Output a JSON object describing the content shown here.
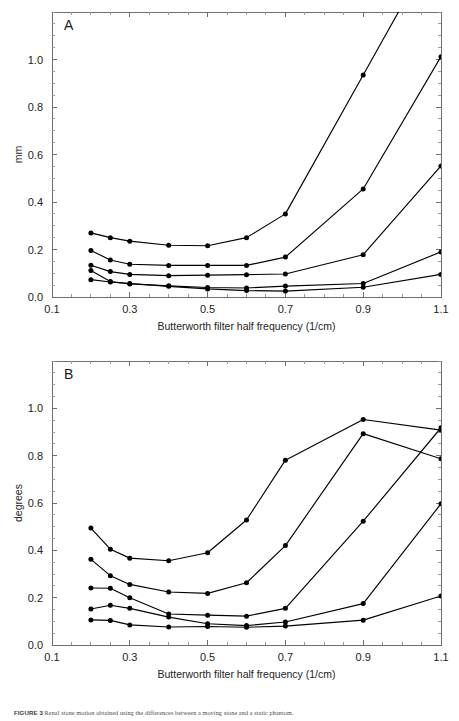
{
  "figure": {
    "caption_label": "FIGURE 3",
    "caption_text": "Renal stone motion obtained using the differences between a moving stone and a static phantom."
  },
  "chart_data": [
    {
      "type": "line",
      "panel": "A",
      "title": "",
      "xlabel": "Butterworth filter half frequency (1/cm)",
      "ylabel": "mm",
      "xlim": [
        0.1,
        1.1
      ],
      "ylim": [
        0.0,
        1.2
      ],
      "xticks": [
        0.1,
        0.3,
        0.5,
        0.7,
        0.9,
        1.1
      ],
      "xtick_labels": [
        "0.1",
        "0.3",
        "0.5",
        "0.7",
        "0.9",
        "1.1"
      ],
      "yticks": [
        0.0,
        0.2,
        0.4,
        0.6,
        0.8,
        1.0
      ],
      "ytick_labels": [
        "0.0",
        "0.2",
        "0.4",
        "0.6",
        "0.8",
        "1.0"
      ],
      "x_minor_step": 0.05,
      "y_minor_step": 0.05,
      "grid": false,
      "legend": "none",
      "x": [
        0.2,
        0.25,
        0.3,
        0.4,
        0.5,
        0.6,
        0.7,
        0.8,
        0.9,
        1.1
      ],
      "series": [
        {
          "name": "series-1",
          "x": [
            0.2,
            0.25,
            0.3,
            0.4,
            0.5,
            0.6,
            0.7,
            0.9,
            1.1
          ],
          "values": [
            0.27,
            0.25,
            0.235,
            0.218,
            0.216,
            0.25,
            0.35,
            0.935,
            1.52
          ]
        },
        {
          "name": "series-2",
          "x": [
            0.2,
            0.25,
            0.3,
            0.4,
            0.5,
            0.6,
            0.7,
            0.9,
            1.1
          ],
          "values": [
            0.196,
            0.156,
            0.138,
            0.133,
            0.133,
            0.133,
            0.168,
            0.455,
            1.012
          ]
        },
        {
          "name": "series-3",
          "x": [
            0.2,
            0.25,
            0.3,
            0.4,
            0.5,
            0.6,
            0.7,
            0.9,
            1.1
          ],
          "values": [
            0.134,
            0.107,
            0.095,
            0.09,
            0.092,
            0.094,
            0.097,
            0.178,
            0.552
          ]
        },
        {
          "name": "series-4",
          "x": [
            0.2,
            0.25,
            0.3,
            0.4,
            0.5,
            0.6,
            0.7,
            0.9,
            1.1
          ],
          "values": [
            0.112,
            0.065,
            0.055,
            0.047,
            0.04,
            0.038,
            0.046,
            0.057,
            0.19
          ]
        },
        {
          "name": "series-5",
          "x": [
            0.2,
            0.25,
            0.3,
            0.4,
            0.5,
            0.6,
            0.7,
            0.9,
            1.1
          ],
          "values": [
            0.073,
            0.063,
            0.057,
            0.045,
            0.034,
            0.027,
            0.025,
            0.041,
            0.095
          ]
        }
      ]
    },
    {
      "type": "line",
      "panel": "B",
      "title": "",
      "xlabel": "Butterworth filter half frequency (1/cm)",
      "ylabel": "degrees",
      "xlim": [
        0.1,
        1.1
      ],
      "ylim": [
        0.0,
        1.2
      ],
      "xticks": [
        0.1,
        0.3,
        0.5,
        0.7,
        0.9,
        1.1
      ],
      "xtick_labels": [
        "0.1",
        "0.3",
        "0.5",
        "0.7",
        "0.9",
        "1.1"
      ],
      "yticks": [
        0.0,
        0.2,
        0.4,
        0.6,
        0.8,
        1.0
      ],
      "ytick_labels": [
        "0.0",
        "0.2",
        "0.4",
        "0.6",
        "0.8",
        "1.0"
      ],
      "x_minor_step": 0.05,
      "y_minor_step": 0.05,
      "grid": false,
      "legend": "none",
      "x": [
        0.2,
        0.25,
        0.3,
        0.4,
        0.5,
        0.6,
        0.7,
        0.9,
        1.1
      ],
      "series": [
        {
          "name": "series-1",
          "x": [
            0.2,
            0.25,
            0.3,
            0.4,
            0.5,
            0.6,
            0.7,
            0.9,
            1.1
          ],
          "values": [
            0.494,
            0.405,
            0.367,
            0.356,
            0.39,
            0.528,
            0.781,
            0.953,
            0.908
          ]
        },
        {
          "name": "series-2",
          "x": [
            0.2,
            0.25,
            0.3,
            0.4,
            0.5,
            0.6,
            0.7,
            0.9,
            1.1
          ],
          "values": [
            0.362,
            0.293,
            0.256,
            0.224,
            0.218,
            0.263,
            0.42,
            0.893,
            0.787
          ]
        },
        {
          "name": "series-3",
          "x": [
            0.2,
            0.25,
            0.3,
            0.4,
            0.5,
            0.6,
            0.7,
            0.9,
            1.1
          ],
          "values": [
            0.241,
            0.24,
            0.2,
            0.131,
            0.126,
            0.122,
            0.155,
            0.523,
            0.918
          ]
        },
        {
          "name": "series-4",
          "x": [
            0.2,
            0.25,
            0.3,
            0.4,
            0.5,
            0.6,
            0.7,
            0.9,
            1.1
          ],
          "values": [
            0.152,
            0.168,
            0.155,
            0.118,
            0.09,
            0.082,
            0.097,
            0.175,
            0.597
          ]
        },
        {
          "name": "series-5",
          "x": [
            0.2,
            0.25,
            0.3,
            0.4,
            0.5,
            0.6,
            0.7,
            0.9,
            1.1
          ],
          "values": [
            0.106,
            0.104,
            0.085,
            0.076,
            0.078,
            0.075,
            0.08,
            0.105,
            0.207
          ]
        }
      ]
    }
  ]
}
